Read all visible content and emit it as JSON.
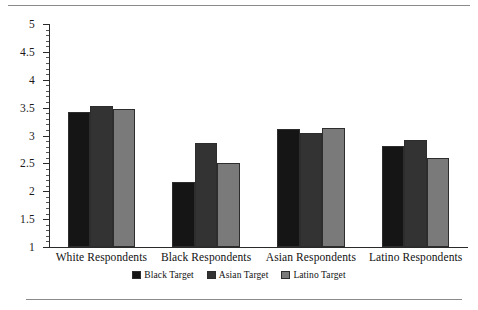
{
  "chart_data": {
    "type": "bar",
    "title": "",
    "subtitle": "",
    "xlabel": "",
    "ylabel": "",
    "ylim": [
      1,
      5
    ],
    "ytick_labels": [
      "1",
      "1.5",
      "2",
      "2.5",
      "3",
      "3.5",
      "4",
      "4.5",
      "5"
    ],
    "ytick_values": [
      1,
      1.5,
      2,
      2.5,
      3,
      3.5,
      4,
      4.5,
      5
    ],
    "ytick_step": 0.5,
    "minor_tick_step": 0.1,
    "grid": false,
    "legend_position": "bottom-center",
    "categories": [
      "White Respondents",
      "Black Respondents",
      "Asian Respondents",
      "Latino Respondents"
    ],
    "series": [
      {
        "name": "Black Target",
        "color": "#151515",
        "values": [
          3.42,
          2.17,
          3.12,
          2.82
        ]
      },
      {
        "name": "Asian Target",
        "color": "#333333",
        "values": [
          3.53,
          2.87,
          3.05,
          2.92
        ]
      },
      {
        "name": "Latino Target",
        "color": "#7a7a7a",
        "values": [
          3.48,
          2.5,
          3.13,
          2.6
        ]
      }
    ]
  },
  "figure": {
    "rule_color": "#8a8a8a",
    "axis_color": "#2a2a2a",
    "background": "#ffffff"
  }
}
